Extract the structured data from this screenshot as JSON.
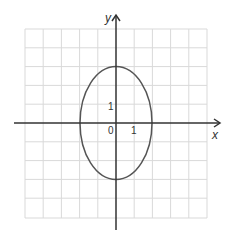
{
  "figure": {
    "type": "ellipse-on-grid",
    "axis_labels": {
      "x": "x",
      "y": "y"
    },
    "tick_labels": {
      "origin": "0",
      "x_one": "1",
      "y_one": "1"
    },
    "ellipse": {
      "center": [
        0,
        0
      ],
      "semi_axis_x": 2,
      "semi_axis_y": 3
    },
    "grid": {
      "x_range": [
        -5,
        5
      ],
      "y_range": [
        -5,
        5
      ]
    },
    "colors": {
      "grid": "#d9d9d9",
      "axis": "#333333",
      "curve": "#555555"
    }
  }
}
